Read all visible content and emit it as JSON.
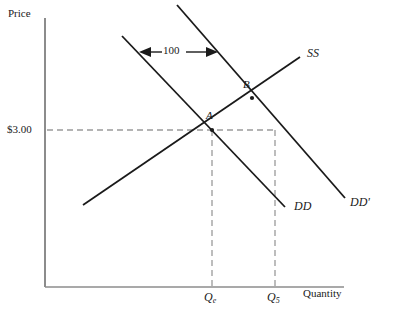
{
  "figure": {
    "type": "economics-supply-demand-diagram",
    "background_color": "#ffffff",
    "line_color": "#1a1a1a",
    "axis_color": "#808080",
    "dash_color": "#9a9a9a"
  },
  "axes": {
    "y_axis_label": "Price",
    "x_axis_label": "Quantity",
    "origin": {
      "x": 45,
      "y": 287
    },
    "y_top": 18,
    "x_right": 344
  },
  "ticks": {
    "price": [
      {
        "label": "$3.00",
        "y": 130
      }
    ],
    "quantity": [
      {
        "label": "Q",
        "sub": "e",
        "x": 212
      },
      {
        "label": "Q",
        "sub": "5",
        "x": 275
      }
    ]
  },
  "curves": [
    {
      "name": "SS",
      "label": "SS",
      "kind": "supply",
      "x1": 83,
      "y1": 205,
      "x2": 300,
      "y2": 57,
      "label_x": 307,
      "label_y": 47
    },
    {
      "name": "DD",
      "label": "DD",
      "kind": "demand-original",
      "x1": 122,
      "y1": 36,
      "x2": 285,
      "y2": 207,
      "label_x": 294,
      "label_y": 204
    },
    {
      "name": "DD'",
      "label": "DD'",
      "kind": "demand-shifted",
      "x1": 177,
      "y1": 5,
      "x2": 345,
      "y2": 198,
      "label_x": 350,
      "label_y": 198
    }
  ],
  "points": [
    {
      "name": "A",
      "label": "A",
      "x": 212,
      "y": 130,
      "label_x": 206,
      "label_y": 112
    },
    {
      "name": "B",
      "label": "B",
      "x": 252,
      "y": 98,
      "label_x": 243,
      "label_y": 80
    }
  ],
  "annotation": {
    "shift_label": "100",
    "arrow_y": 52,
    "arrow_x_left": 140,
    "arrow_x_right": 216,
    "label_x": 163,
    "label_y": 45
  },
  "guides": {
    "horizontal_price_line": {
      "x1": 47,
      "y1": 130,
      "x2": 275,
      "y2": 130
    },
    "vertical_qe_line": {
      "x": 212,
      "y1": 130,
      "y2": 287
    },
    "vertical_q5_line": {
      "x": 275,
      "y1": 130,
      "y2": 287
    }
  }
}
